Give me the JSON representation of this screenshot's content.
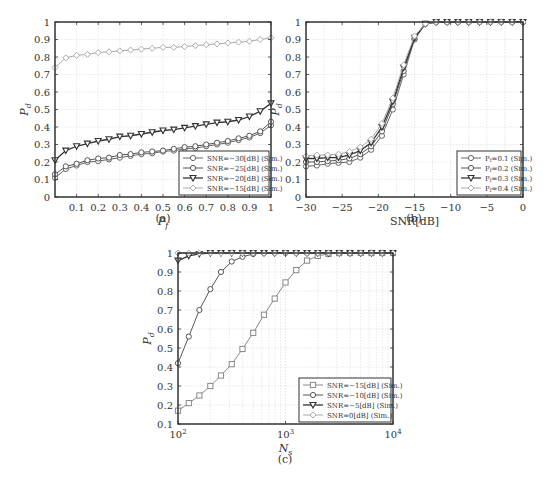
{
  "chart_data": [
    {
      "panel": "(a)",
      "type": "line",
      "xlabel": "P_f",
      "ylabel": "P_d",
      "xlim": [
        0,
        1
      ],
      "ylim": [
        0,
        1
      ],
      "xticks": [
        0.1,
        0.2,
        0.3,
        0.4,
        0.5,
        0.6,
        0.7,
        0.8,
        0.9,
        1
      ],
      "xtick_labels": [
        "0.1",
        "0.2",
        "0.3",
        "0.4",
        "0.5",
        "0.6",
        "0.7",
        "0.8",
        "0.9",
        "1"
      ],
      "yticks": [
        0,
        0.1,
        0.2,
        0.3,
        0.4,
        0.5,
        0.6,
        0.7,
        0.8,
        0.9,
        1
      ],
      "ytick_labels": [
        "0",
        "0.1",
        "0.2",
        "0.3",
        "0.4",
        "0.5",
        "0.6",
        "0.7",
        "0.8",
        "0.9",
        "1"
      ],
      "grid": true,
      "legend_position": "lower right",
      "x": [
        0.0,
        0.05,
        0.1,
        0.15,
        0.2,
        0.25,
        0.3,
        0.35,
        0.4,
        0.45,
        0.5,
        0.55,
        0.6,
        0.65,
        0.7,
        0.75,
        0.8,
        0.85,
        0.9,
        0.95,
        1.0
      ],
      "series": [
        {
          "name": "SNR=−30[dB] (Sim.)",
          "marker": "circle",
          "color": "#666666",
          "values": [
            0.11,
            0.16,
            0.18,
            0.2,
            0.205,
            0.215,
            0.225,
            0.235,
            0.245,
            0.25,
            0.26,
            0.265,
            0.275,
            0.28,
            0.29,
            0.3,
            0.31,
            0.325,
            0.34,
            0.365,
            0.41
          ]
        },
        {
          "name": "SNR=−25[dB] (Sim.)",
          "marker": "circle",
          "color": "#555555",
          "values": [
            0.13,
            0.175,
            0.19,
            0.21,
            0.22,
            0.225,
            0.24,
            0.245,
            0.255,
            0.26,
            0.265,
            0.275,
            0.285,
            0.29,
            0.3,
            0.31,
            0.32,
            0.335,
            0.35,
            0.375,
            0.43
          ]
        },
        {
          "name": "SNR=−20[dB] (Sim.)",
          "marker": "triangle-down",
          "color": "#333333",
          "values": [
            0.21,
            0.265,
            0.29,
            0.305,
            0.32,
            0.33,
            0.345,
            0.35,
            0.36,
            0.37,
            0.38,
            0.385,
            0.395,
            0.405,
            0.415,
            0.425,
            0.43,
            0.44,
            0.46,
            0.49,
            0.535
          ]
        },
        {
          "name": "SNR=−15[dB] (Sim.)",
          "marker": "diamond",
          "color": "#aaaaaa",
          "values": [
            0.74,
            0.795,
            0.81,
            0.815,
            0.825,
            0.83,
            0.835,
            0.84,
            0.845,
            0.85,
            0.855,
            0.855,
            0.86,
            0.865,
            0.87,
            0.875,
            0.88,
            0.885,
            0.89,
            0.9,
            0.91
          ]
        }
      ],
      "caption": "(a)"
    },
    {
      "panel": "(b)",
      "type": "line",
      "xlabel": "SNR[dB]",
      "ylabel": "P_d",
      "xlim": [
        -30,
        0
      ],
      "ylim": [
        0,
        1
      ],
      "xticks": [
        -30,
        -25,
        -20,
        -15,
        -10,
        -5,
        0
      ],
      "xtick_labels": [
        "−30",
        "−25",
        "−20",
        "−15",
        "−10",
        "−5",
        "0"
      ],
      "yticks": [
        0,
        0.1,
        0.2,
        0.3,
        0.4,
        0.5,
        0.6,
        0.7,
        0.8,
        0.9,
        1
      ],
      "ytick_labels": [
        "0",
        "0.1",
        "0.2",
        "0.3",
        "0.4",
        "0.5",
        "0.6",
        "0.7",
        "0.8",
        "0.9",
        "1"
      ],
      "grid": true,
      "legend_position": "lower right",
      "x": [
        -30,
        -28.5,
        -27,
        -25.5,
        -24,
        -22.5,
        -21,
        -19.5,
        -18,
        -16.5,
        -15,
        -13.5,
        -12,
        -10.5,
        -9,
        -7.5,
        -6,
        -4.5,
        -3,
        -1.5,
        0
      ],
      "series": [
        {
          "name": "P_f=0.1 (Sim.)",
          "marker": "circle",
          "color": "#666666",
          "values": [
            0.175,
            0.18,
            0.19,
            0.195,
            0.2,
            0.225,
            0.27,
            0.35,
            0.5,
            0.7,
            0.9,
            0.99,
            1,
            1,
            1,
            1,
            1,
            1,
            1,
            1,
            1
          ]
        },
        {
          "name": "P_f=0.2 (Sim.)",
          "marker": "circle",
          "color": "#555555",
          "values": [
            0.2,
            0.2,
            0.205,
            0.21,
            0.22,
            0.245,
            0.29,
            0.375,
            0.53,
            0.72,
            0.905,
            0.99,
            1,
            1,
            1,
            1,
            1,
            1,
            1,
            1,
            1
          ]
        },
        {
          "name": "P_f=0.3 (Sim.)",
          "marker": "triangle-down",
          "color": "#333333",
          "values": [
            0.22,
            0.22,
            0.225,
            0.225,
            0.24,
            0.265,
            0.31,
            0.4,
            0.545,
            0.74,
            0.91,
            0.99,
            1,
            1,
            1,
            1,
            1,
            1,
            1,
            1,
            1
          ]
        },
        {
          "name": "P_f=0.4 (Sim.)",
          "marker": "diamond",
          "color": "#aaaaaa",
          "values": [
            0.235,
            0.24,
            0.24,
            0.245,
            0.26,
            0.285,
            0.33,
            0.42,
            0.565,
            0.755,
            0.92,
            0.99,
            1,
            1,
            1,
            1,
            1,
            1,
            1,
            1,
            1
          ]
        }
      ],
      "caption": "(b)"
    },
    {
      "panel": "(c)",
      "type": "line",
      "xscale": "log",
      "xlabel": "N_s",
      "ylabel": "P_d",
      "xlim": [
        100,
        10000
      ],
      "ylim": [
        0.1,
        1
      ],
      "xticks": [
        100,
        1000,
        10000
      ],
      "xtick_labels": [
        "10^2",
        "10^3",
        "10^4"
      ],
      "yticks": [
        0.1,
        0.2,
        0.3,
        0.4,
        0.5,
        0.6,
        0.7,
        0.8,
        0.9,
        1
      ],
      "ytick_labels": [
        "0.1",
        "0.2",
        "0.3",
        "0.4",
        "0.5",
        "0.6",
        "0.7",
        "0.8",
        "0.9",
        "1"
      ],
      "grid": true,
      "legend_position": "lower right",
      "x": [
        100,
        126,
        158,
        200,
        251,
        316,
        398,
        501,
        631,
        794,
        1000,
        1259,
        1585,
        1995,
        2512,
        3162,
        3981,
        5012,
        6310,
        7943,
        10000
      ],
      "series": [
        {
          "name": "SNR=−15[dB] (Sim.)",
          "marker": "square",
          "color": "#888888",
          "values": [
            0.17,
            0.21,
            0.25,
            0.3,
            0.355,
            0.415,
            0.495,
            0.58,
            0.675,
            0.76,
            0.845,
            0.91,
            0.96,
            0.985,
            0.995,
            1,
            1,
            1,
            1,
            1,
            1
          ]
        },
        {
          "name": "SNR=−10[dB] (Sim.)",
          "marker": "circle",
          "color": "#555555",
          "values": [
            0.42,
            0.56,
            0.7,
            0.81,
            0.9,
            0.955,
            0.98,
            0.995,
            1,
            1,
            1,
            1,
            1,
            1,
            1,
            1,
            1,
            1,
            1,
            1,
            1
          ]
        },
        {
          "name": "SNR=−5[dB] (Sim.)",
          "marker": "triangle-down",
          "color": "#333333",
          "values": [
            0.96,
            0.985,
            0.995,
            1,
            1,
            1,
            1,
            1,
            1,
            1,
            1,
            1,
            1,
            1,
            1,
            1,
            1,
            1,
            1,
            1,
            1
          ]
        },
        {
          "name": "SNR=0[dB] (Sim.)",
          "marker": "diamond",
          "color": "#aaaaaa",
          "values": [
            1,
            1,
            1,
            1,
            1,
            1,
            1,
            1,
            1,
            1,
            1,
            1,
            1,
            1,
            1,
            1,
            1,
            1,
            1,
            1,
            1
          ]
        }
      ],
      "caption": "(c)"
    }
  ],
  "labels": {
    "a_caption": "(a)",
    "b_caption": "(b)",
    "c_caption": "(c)"
  }
}
